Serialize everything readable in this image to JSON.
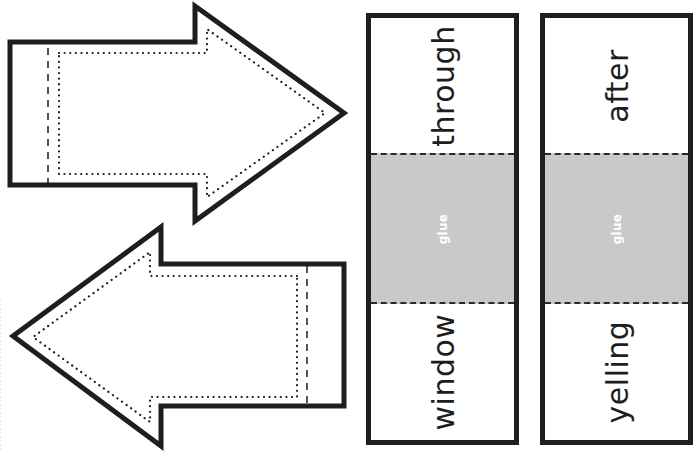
{
  "worksheet": {
    "arrows": [
      {
        "direction": "right",
        "outline": "solid",
        "fold_line": "dashed",
        "cut_guide": "dotted"
      },
      {
        "direction": "left",
        "outline": "solid",
        "fold_line": "dashed",
        "cut_guide": "dotted"
      }
    ],
    "strips": [
      {
        "top_word": "through",
        "glue_label": "glue",
        "bottom_word": "window"
      },
      {
        "top_word": "after",
        "glue_label": "glue",
        "bottom_word": "yelling"
      }
    ],
    "colors": {
      "outline": "#1e1e1e",
      "glue_fill": "#c9c9c9",
      "glue_text": "#ffffff",
      "background": "#ffffff"
    }
  }
}
